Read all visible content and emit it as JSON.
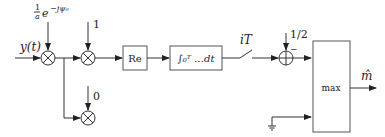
{
  "diagram": {
    "input_label": "y(t)",
    "mixer1_coef_frac": "1",
    "mixer1_coef_den": "a",
    "mixer1_coef_exp": "e",
    "mixer1_coef_sup": "−jψ₀",
    "mixer2_coef": "1",
    "mixer3_coef": "0",
    "re_block": "Re",
    "integrator_block": "∫₀ᵀ …dt",
    "switch_label": "iT",
    "adder_coef": "1/2",
    "adder_sign": "−",
    "max_block": "max",
    "output_label": "m̂"
  }
}
